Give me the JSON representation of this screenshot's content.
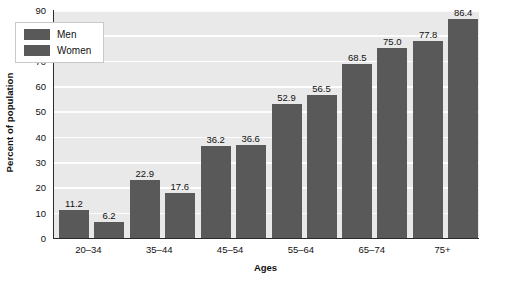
{
  "chart_data": {
    "type": "bar",
    "title": "",
    "xlabel": "Ages",
    "ylabel": "Percent of population",
    "categories": [
      "20–34",
      "35–44",
      "45–54",
      "55–64",
      "65–74",
      "75+"
    ],
    "series": [
      {
        "name": "Men",
        "values": [
          11.2,
          22.9,
          36.2,
          52.9,
          68.5,
          77.8
        ],
        "color": "#595959"
      },
      {
        "name": "Women",
        "values": [
          6.2,
          17.6,
          36.6,
          56.5,
          75.0,
          86.4
        ],
        "color": "#595959"
      }
    ],
    "ylim": [
      0,
      90
    ],
    "yticks": [
      0,
      10,
      20,
      30,
      40,
      50,
      60,
      70,
      80,
      90
    ],
    "ytick_labels": [
      "0",
      "10",
      "20",
      "30",
      "40",
      "50",
      "60",
      "70",
      "80",
      "90"
    ],
    "data_labels": {
      "Men": [
        "11.2",
        "22.9",
        "36.2",
        "52.9",
        "68.5",
        "77.8"
      ],
      "Women": [
        "6.2",
        "17.6",
        "36.6",
        "56.5",
        "75.0",
        "86.4"
      ]
    },
    "grid": true,
    "grid_color": "#fdfdfd",
    "plot_background": "#e9e9e9",
    "legend_position": "upper left",
    "legend_entries": [
      "Men",
      "Women"
    ]
  },
  "axes": {
    "y_title": "Percent of population",
    "x_title": "Ages"
  },
  "legend": {
    "items": [
      {
        "label": "Men"
      },
      {
        "label": "Women"
      }
    ]
  }
}
